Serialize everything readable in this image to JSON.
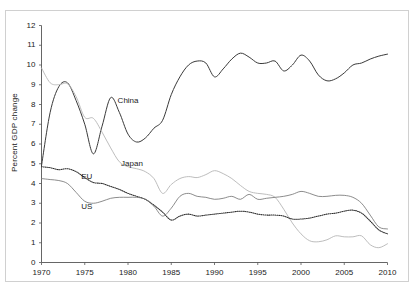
{
  "chart_data": {
    "type": "line",
    "title": "",
    "xlabel": "",
    "ylabel": "Percent GDP change",
    "xlim": [
      1970,
      2010
    ],
    "ylim": [
      0,
      12
    ],
    "xticks": [
      1970,
      1975,
      1980,
      1985,
      1990,
      1995,
      2000,
      2005,
      2010
    ],
    "yticks": [
      0,
      1,
      2,
      3,
      4,
      5,
      6,
      7,
      8,
      9,
      10,
      11,
      12
    ],
    "grid": false,
    "legend_position": "inline-annotations",
    "annotations": [
      {
        "text": "China",
        "x": 1978.8,
        "y": 8.2
      },
      {
        "text": "Japan",
        "x": 1979.2,
        "y": 5.0
      },
      {
        "text": "EU",
        "x": 1974.6,
        "y": 4.35
      },
      {
        "text": "US",
        "x": 1974.6,
        "y": 2.8
      }
    ],
    "series": [
      {
        "name": "China",
        "style": "solid",
        "color": "#3a3a3a",
        "x": [
          1970,
          1971,
          1972,
          1973,
          1974,
          1975,
          1976,
          1977,
          1978,
          1979,
          1980,
          1981,
          1982,
          1983,
          1984,
          1985,
          1986,
          1987,
          1988,
          1989,
          1990,
          1991,
          1992,
          1993,
          1994,
          1995,
          1996,
          1997,
          1998,
          1999,
          2000,
          2001,
          2002,
          2003,
          2004,
          2005,
          2006,
          2007,
          2008,
          2009,
          2010
        ],
        "values": [
          4.9,
          7.6,
          8.9,
          9.1,
          8.2,
          7.0,
          5.5,
          6.9,
          8.35,
          7.6,
          6.5,
          6.1,
          6.3,
          6.8,
          7.2,
          8.5,
          9.4,
          10.0,
          10.2,
          10.1,
          9.4,
          9.8,
          10.3,
          10.6,
          10.4,
          10.1,
          10.1,
          10.2,
          9.7,
          10.0,
          10.5,
          10.2,
          9.5,
          9.2,
          9.3,
          9.6,
          10.0,
          10.1,
          10.3,
          10.45,
          10.55
        ]
      },
      {
        "name": "Japan",
        "style": "solid-light",
        "color": "#b5b5b5",
        "x": [
          1970,
          1971,
          1972,
          1973,
          1974,
          1975,
          1976,
          1977,
          1978,
          1979,
          1980,
          1981,
          1982,
          1983,
          1984,
          1985,
          1986,
          1987,
          1988,
          1989,
          1990,
          1991,
          1992,
          1993,
          1994,
          1995,
          1996,
          1997,
          1998,
          1999,
          2000,
          2001,
          2002,
          2003,
          2004,
          2005,
          2006,
          2007,
          2008,
          2009,
          2010
        ],
        "values": [
          9.85,
          9.1,
          9.0,
          9.05,
          8.4,
          7.35,
          7.3,
          6.6,
          5.8,
          5.1,
          4.85,
          4.75,
          4.6,
          4.25,
          3.5,
          3.95,
          4.25,
          4.35,
          4.3,
          4.45,
          4.65,
          4.5,
          4.25,
          3.9,
          3.6,
          3.5,
          3.45,
          3.3,
          2.7,
          2.0,
          1.45,
          1.1,
          1.05,
          1.15,
          1.35,
          1.3,
          1.3,
          1.35,
          0.9,
          0.75,
          0.95
        ]
      },
      {
        "name": "EU",
        "style": "dotted",
        "color": "#2b2b2b",
        "x": [
          1970,
          1971,
          1972,
          1973,
          1974,
          1975,
          1976,
          1977,
          1978,
          1979,
          1980,
          1981,
          1982,
          1983,
          1984,
          1985,
          1986,
          1987,
          1988,
          1989,
          1990,
          1991,
          1992,
          1993,
          1994,
          1995,
          1996,
          1997,
          1998,
          1999,
          2000,
          2001,
          2002,
          2003,
          2004,
          2005,
          2006,
          2007,
          2008,
          2009,
          2010
        ],
        "values": [
          4.85,
          4.8,
          4.7,
          4.75,
          4.6,
          4.3,
          4.05,
          4.0,
          3.85,
          3.7,
          3.5,
          3.35,
          3.2,
          2.9,
          2.55,
          2.15,
          2.35,
          2.45,
          2.35,
          2.4,
          2.45,
          2.5,
          2.55,
          2.6,
          2.55,
          2.45,
          2.4,
          2.4,
          2.35,
          2.2,
          2.2,
          2.25,
          2.35,
          2.45,
          2.5,
          2.6,
          2.65,
          2.5,
          2.1,
          1.65,
          1.45
        ]
      },
      {
        "name": "US",
        "style": "solid-thin",
        "color": "#777777",
        "x": [
          1970,
          1971,
          1972,
          1973,
          1974,
          1975,
          1976,
          1977,
          1978,
          1979,
          1980,
          1981,
          1982,
          1983,
          1984,
          1985,
          1986,
          1987,
          1988,
          1989,
          1990,
          1991,
          1992,
          1993,
          1994,
          1995,
          1996,
          1997,
          1998,
          1999,
          2000,
          2001,
          2002,
          2003,
          2004,
          2005,
          2006,
          2007,
          2008,
          2009,
          2010
        ],
        "values": [
          4.25,
          4.2,
          4.15,
          4.0,
          3.55,
          3.1,
          3.0,
          3.1,
          3.25,
          3.3,
          3.3,
          3.3,
          3.2,
          2.85,
          2.35,
          2.75,
          3.35,
          3.5,
          3.35,
          3.3,
          3.2,
          3.25,
          3.35,
          3.2,
          3.45,
          3.2,
          3.25,
          3.3,
          3.35,
          3.45,
          3.6,
          3.5,
          3.35,
          3.35,
          3.4,
          3.4,
          3.3,
          3.0,
          2.4,
          1.8,
          1.7
        ]
      }
    ]
  },
  "axis": {
    "y_title": "Percent GDP change",
    "y_tick_labels": [
      "12",
      "11",
      "10",
      "9",
      "8",
      "7",
      "6",
      "5",
      "4",
      "3",
      "2",
      "1",
      "0"
    ],
    "x_tick_labels": [
      "1970",
      "1975",
      "1980",
      "1985",
      "1990",
      "1995",
      "2000",
      "2005",
      "2010"
    ]
  },
  "labels": {
    "china": "China",
    "japan": "Japan",
    "eu": "EU",
    "us": "US"
  },
  "colors": {
    "china": "#3a3a3a",
    "japan": "#b5b5b5",
    "eu": "#2b2b2b",
    "us": "#777777",
    "axis": "#555555",
    "frame": "#d0d0d0",
    "background": "#ffffff"
  }
}
